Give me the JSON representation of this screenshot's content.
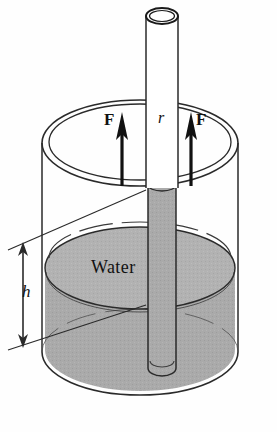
{
  "figure": {
    "type": "capillary-rise-diagram",
    "background_color": "#fefefe",
    "ink_color": "#111111",
    "water_fill_color": "#a9a9a9",
    "water_fill_color_light": "#b8b8b8",
    "glass_fill_color": "#ffffff"
  },
  "labels": {
    "force_left": "F",
    "force_right": "F",
    "radius": "r",
    "height": "h",
    "water": "Water"
  },
  "annotations": {
    "force_arrow_left": "upward-force-arrow",
    "force_arrow_right": "upward-force-arrow",
    "height_dimension": "double-headed-height-arrow",
    "radius_marker": "tube-radius-label"
  },
  "geometry": {
    "tube_outer_left": 146,
    "tube_outer_right": 178,
    "tube_top_y": 8,
    "tube_bottom_y": 375,
    "beaker_center_x": 140,
    "beaker_rim_y": 143,
    "beaker_rim_rx": 98,
    "beaker_rim_ry": 43,
    "beaker_bottom_y": 375,
    "water_surface_y": 268,
    "water_surface_rx": 95,
    "water_surface_ry": 41,
    "capillary_meniscus_y": 185,
    "height_arrow_x": 22,
    "height_arrow_top_y": 243,
    "height_arrow_bottom_y": 340
  }
}
